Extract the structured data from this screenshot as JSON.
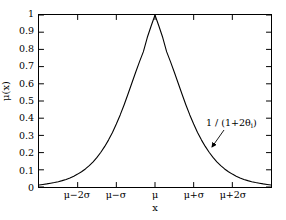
{
  "chart_data": {
    "type": "line",
    "title": "",
    "subtitle": "",
    "xlabel": "x",
    "ylabel": "μ(x)",
    "xlim": [
      -3.0,
      3.0
    ],
    "ylim": [
      0,
      1
    ],
    "grid": false,
    "legend": null,
    "x_tick_labels": [
      "μ−2σ",
      "μ−σ",
      "μ",
      "μ+σ",
      "μ+2σ"
    ],
    "x_tick_values": [
      -2,
      -1,
      0,
      1,
      2
    ],
    "y_tick_labels": [
      "0",
      "0.1",
      "0.2",
      "0.3",
      "0.4",
      "0.5",
      "0.6",
      "0.7",
      "0.8",
      "0.9",
      "1"
    ],
    "y_tick_values": [
      0,
      0.1,
      0.2,
      0.3,
      0.4,
      0.5,
      0.6,
      0.7,
      0.8,
      0.9,
      1.0
    ],
    "series": [
      {
        "name": "membership-function",
        "color": "#000000",
        "x": [
          -3.0,
          -2.9,
          -2.8,
          -2.7,
          -2.6,
          -2.5,
          -2.4,
          -2.3,
          -2.2,
          -2.1,
          -2.0,
          -1.9,
          -1.8,
          -1.7,
          -1.6,
          -1.5,
          -1.4,
          -1.3,
          -1.2,
          -1.1,
          -1.0,
          -0.9,
          -0.8,
          -0.7,
          -0.6,
          -0.5,
          -0.4,
          -0.3,
          -0.2,
          -0.1,
          0.0,
          0.1,
          0.2,
          0.3,
          0.4,
          0.5,
          0.6,
          0.7,
          0.8,
          0.9,
          1.0,
          1.1,
          1.2,
          1.3,
          1.4,
          1.5,
          1.6,
          1.7,
          1.8,
          1.9,
          2.0,
          2.1,
          2.2,
          2.3,
          2.4,
          2.5,
          2.6,
          2.7,
          2.8,
          2.9,
          3.0
        ],
        "y": [
          0.012,
          0.015,
          0.018,
          0.022,
          0.026,
          0.031,
          0.037,
          0.044,
          0.053,
          0.063,
          0.075,
          0.089,
          0.105,
          0.124,
          0.146,
          0.172,
          0.202,
          0.236,
          0.274,
          0.317,
          0.366,
          0.419,
          0.477,
          0.539,
          0.603,
          0.667,
          0.729,
          0.787,
          0.869,
          0.936,
          1.0,
          0.936,
          0.869,
          0.787,
          0.729,
          0.667,
          0.603,
          0.539,
          0.477,
          0.419,
          0.366,
          0.317,
          0.274,
          0.236,
          0.202,
          0.172,
          0.146,
          0.124,
          0.105,
          0.089,
          0.075,
          0.063,
          0.053,
          0.044,
          0.037,
          0.031,
          0.026,
          0.022,
          0.018,
          0.015,
          0.012
        ]
      }
    ],
    "annotations": [
      {
        "name": "peak-formula",
        "text_prefix": "1 / (1+2θ",
        "text_subscript": "i",
        "text_suffix": ")",
        "full_text": "1 / (1+2θi)",
        "arrow": {
          "from_x": 224,
          "from_y": 130,
          "to_x": 212,
          "to_y": 147
        }
      }
    ]
  },
  "axes": {
    "frame_color": "#000000",
    "curve_color": "#000000"
  }
}
